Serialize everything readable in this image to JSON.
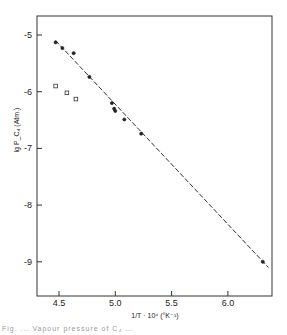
{
  "chart_data": {
    "type": "scatter",
    "title": "",
    "xlabel": "1/T · 10⁴ (°K⁻¹)",
    "ylabel": "lg P_C₄ (Atm.)",
    "xlim": [
      4.3,
      6.4
    ],
    "ylim": [
      -9.6,
      -4.65
    ],
    "grid": false,
    "legend": null,
    "x_ticks": [
      4.5,
      5.0,
      5.5,
      6.0
    ],
    "x_tick_labels": [
      "4.5",
      "5.0",
      "5.5",
      "6.0"
    ],
    "y_ticks": [
      -5,
      -6,
      -7,
      -8,
      -9
    ],
    "y_tick_labels": [
      "-5",
      "-6",
      "-7",
      "-8",
      "-9"
    ],
    "series": [
      {
        "name": "filled circles",
        "marker": "circle-filled",
        "points": [
          {
            "x": 4.47,
            "y": -5.13
          },
          {
            "x": 4.53,
            "y": -5.23
          },
          {
            "x": 4.63,
            "y": -5.32
          },
          {
            "x": 4.77,
            "y": -5.74
          },
          {
            "x": 4.97,
            "y": -6.2
          },
          {
            "x": 4.99,
            "y": -6.3
          },
          {
            "x": 5.0,
            "y": -6.34
          },
          {
            "x": 5.08,
            "y": -6.49
          },
          {
            "x": 5.23,
            "y": -6.74
          },
          {
            "x": 6.31,
            "y": -9.0
          }
        ]
      },
      {
        "name": "open squares",
        "marker": "square-open",
        "points": [
          {
            "x": 4.47,
            "y": -5.9
          },
          {
            "x": 4.57,
            "y": -6.02
          },
          {
            "x": 4.65,
            "y": -6.13
          }
        ]
      },
      {
        "name": "fit line",
        "type": "line",
        "style": "dashed",
        "points": [
          {
            "x": 4.47,
            "y": -5.1
          },
          {
            "x": 6.36,
            "y": -9.1
          }
        ]
      }
    ]
  },
  "caption": "Fig. ... Vapour pressure of C₄ ..."
}
